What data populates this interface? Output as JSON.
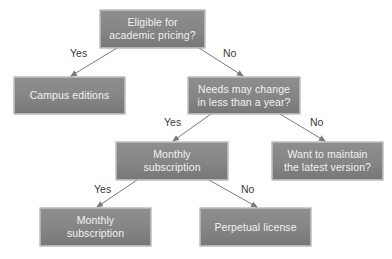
{
  "diagram": {
    "type": "decision-tree",
    "colors": {
      "node_fill": "#858585",
      "node_border": "#b4b4b4",
      "node_text": "#f2f2f2",
      "edge": "#7a7a7a",
      "edge_label": "#3a3a3a",
      "background": "#ffffff"
    },
    "nodes": {
      "root": {
        "text": "Eligible for\nacademic pricing?"
      },
      "campus": {
        "text": "Campus editions"
      },
      "needs": {
        "text": "Needs may change\nin less than a year?"
      },
      "monthly_mid": {
        "text": "Monthly\nsubscription"
      },
      "maintain": {
        "text": "Want to maintain\nthe latest version?"
      },
      "monthly_leaf": {
        "text": "Monthly\nsubscription"
      },
      "perpetual": {
        "text": "Perpetual license"
      }
    },
    "edges": [
      {
        "from": "root",
        "to": "campus",
        "label": "Yes"
      },
      {
        "from": "root",
        "to": "needs",
        "label": "No"
      },
      {
        "from": "needs",
        "to": "monthly_mid",
        "label": "Yes"
      },
      {
        "from": "needs",
        "to": "maintain",
        "label": "No"
      },
      {
        "from": "monthly_mid",
        "to": "monthly_leaf",
        "label": "Yes"
      },
      {
        "from": "monthly_mid",
        "to": "perpetual",
        "label": "No"
      }
    ]
  }
}
